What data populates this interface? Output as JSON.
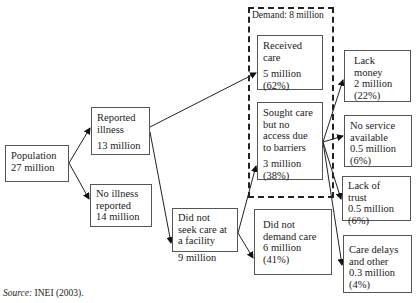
{
  "diagram": {
    "population": {
      "label": "Population",
      "value": "27 million"
    },
    "reported_illness": {
      "label1": "Reported",
      "label2": "illness",
      "value": "13 million"
    },
    "no_illness": {
      "label1": "No illness",
      "label2": "reported",
      "value": "14 million"
    },
    "did_not_seek": {
      "label1": "Did not",
      "label2": "seek care at",
      "label3": "a facility",
      "value": "9 million"
    },
    "demand": {
      "label": "Demand: 8 million"
    },
    "received_care": {
      "label1": "Received",
      "label2": "care",
      "value": "5 million",
      "pct": "(62%)"
    },
    "sought_care": {
      "label1": "Sought care",
      "label2": "but no",
      "label3": "access due",
      "label4": "to barriers",
      "value": "3 million",
      "pct": "(38%)"
    },
    "did_not_demand": {
      "label1": "Did not",
      "label2": "demand care",
      "value": "6 million",
      "pct": "(41%)"
    },
    "lack_money": {
      "label1": "Lack",
      "label2": "money",
      "value": "2 million",
      "pct": "(22%)"
    },
    "no_service": {
      "label1": "No service",
      "label2": "available",
      "value": "0.5 million",
      "pct": "(6%)"
    },
    "lack_trust": {
      "label1": "Lack of",
      "label2": "trust",
      "value": "0.5 million",
      "pct": "(6%)"
    },
    "care_delays": {
      "label1": "Care delays",
      "label2": "and other",
      "value": "0.3 million",
      "pct": "(4%)"
    }
  },
  "source": {
    "prefix": "Source:",
    "text": " INEI (2003)."
  }
}
